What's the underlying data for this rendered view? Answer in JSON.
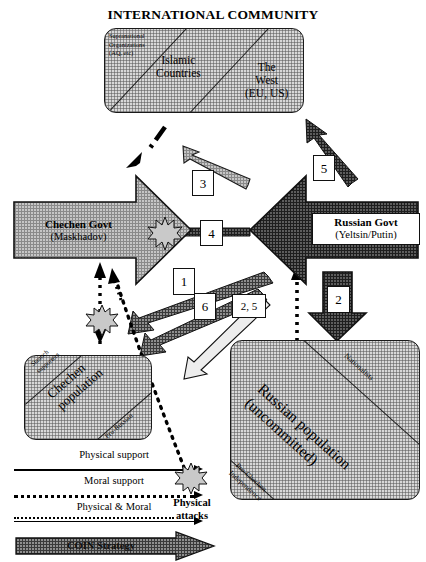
{
  "title": "INTERNATIONAL COMMUNITY",
  "international_community": {
    "segments": [
      {
        "label": "Supranational\nOrganizations\n(AQ, etc)"
      },
      {
        "label": "Islamic\nCountries"
      },
      {
        "label": "The\nWest\n(EU, US)"
      }
    ]
  },
  "actors": {
    "chechen_govt": {
      "name": "Chechen Govt",
      "leader": "(Maskhadov)"
    },
    "russian_govt": {
      "name": "Russian Govt",
      "leader": "(Yeltsin/Putin)"
    }
  },
  "populations": {
    "chechen": {
      "main": "Chechen\npopulation",
      "top_corner": "Staunch\nsupporters",
      "bottom_corner": "Pro-Russian"
    },
    "russian": {
      "main": "Russian population\n(uncommitted)",
      "top_corner": "Nationalists",
      "bottom_corner": "Pro-Chechen\nIndependence"
    }
  },
  "flow_tags": [
    {
      "id": "tag-1",
      "label": "1"
    },
    {
      "id": "tag-2",
      "label": "2"
    },
    {
      "id": "tag-3",
      "label": "3"
    },
    {
      "id": "tag-4",
      "label": "4"
    },
    {
      "id": "tag-5",
      "label": "5"
    },
    {
      "id": "tag-6",
      "label": "6"
    },
    {
      "id": "tag-2-5",
      "label": "2, 5"
    }
  ],
  "legend": {
    "physical_support": "Physical support",
    "moral_support": "Moral support",
    "physical_and_moral": "Physical & Moral",
    "coin_strategy": "COIN Strategy",
    "physical_attacks": "Physical\nattacks"
  },
  "colors": {
    "light_fill": "#b9b9b9",
    "dark_fill": "#585858",
    "hatch_fill": "#d8d8d8",
    "outline": "#111111",
    "burst_fill": "#c9c9c9"
  }
}
